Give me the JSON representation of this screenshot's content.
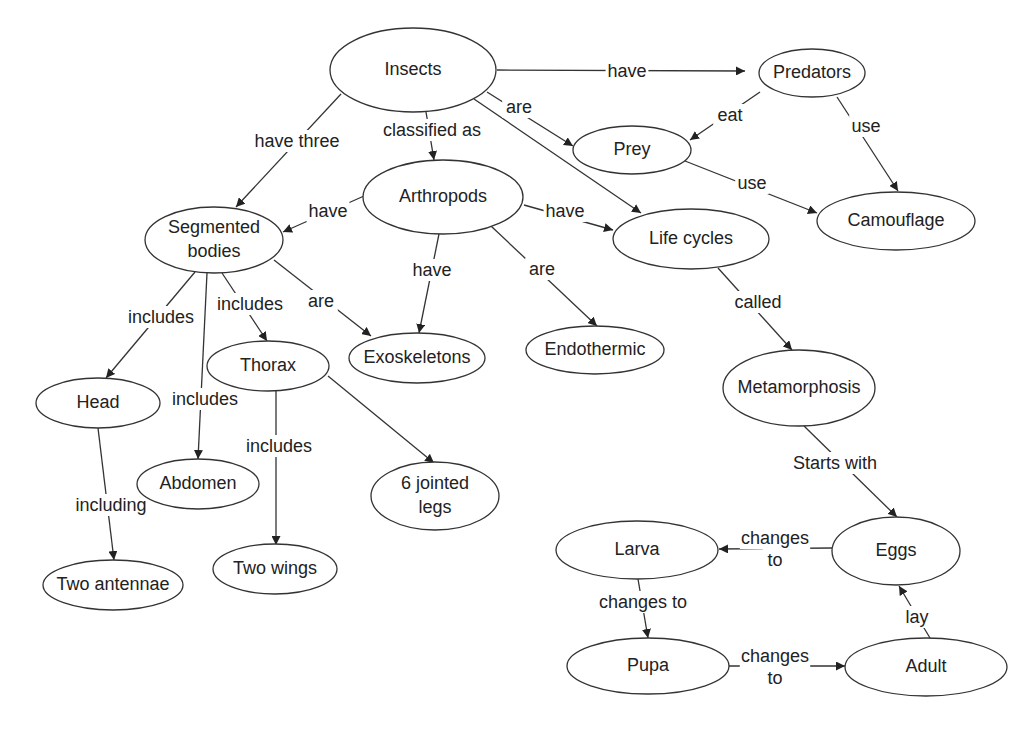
{
  "diagram": {
    "type": "concept-map",
    "topic": "Insects",
    "nodes": [
      {
        "id": "insects",
        "label": "Insects",
        "cx": 413,
        "cy": 70,
        "rx": 83,
        "ry": 42
      },
      {
        "id": "predators",
        "label": "Predators",
        "cx": 812,
        "cy": 73,
        "rx": 53,
        "ry": 24
      },
      {
        "id": "prey",
        "label": "Prey",
        "cx": 632,
        "cy": 150,
        "rx": 59,
        "ry": 24
      },
      {
        "id": "camouflage",
        "label": "Camouflage",
        "cx": 896,
        "cy": 221,
        "rx": 79,
        "ry": 29
      },
      {
        "id": "arthropods",
        "label": "Arthropods",
        "cx": 443,
        "cy": 197,
        "rx": 80,
        "ry": 37
      },
      {
        "id": "life-cycles",
        "label": "Life cycles",
        "cx": 691,
        "cy": 239,
        "rx": 78,
        "ry": 30
      },
      {
        "id": "segmented-bodies",
        "label": "Segmented bodies",
        "lines": [
          "Segmented",
          "bodies"
        ],
        "cx": 214,
        "cy": 240,
        "rx": 69,
        "ry": 33
      },
      {
        "id": "thorax",
        "label": "Thorax",
        "cx": 268,
        "cy": 366,
        "rx": 61,
        "ry": 25
      },
      {
        "id": "exoskeletons",
        "label": "Exoskeletons",
        "cx": 417,
        "cy": 358,
        "rx": 68,
        "ry": 25
      },
      {
        "id": "endothermic",
        "label": "Endothermic",
        "cx": 595,
        "cy": 350,
        "rx": 69,
        "ry": 24
      },
      {
        "id": "metamorphosis",
        "label": "Metamorphosis",
        "cx": 799,
        "cy": 388,
        "rx": 76,
        "ry": 38
      },
      {
        "id": "head",
        "label": "Head",
        "cx": 98,
        "cy": 403,
        "rx": 62,
        "ry": 25
      },
      {
        "id": "abdomen",
        "label": "Abdomen",
        "cx": 198,
        "cy": 484,
        "rx": 61,
        "ry": 25
      },
      {
        "id": "six-jointed-legs",
        "label": "6 jointed legs",
        "lines": [
          "6 jointed",
          "legs"
        ],
        "cx": 435,
        "cy": 496,
        "rx": 64,
        "ry": 34
      },
      {
        "id": "two-wings",
        "label": "Two wings",
        "cx": 275,
        "cy": 569,
        "rx": 62,
        "ry": 25
      },
      {
        "id": "two-antennae",
        "label": "Two antennae",
        "cx": 113,
        "cy": 585,
        "rx": 70,
        "ry": 25
      },
      {
        "id": "eggs",
        "label": "Eggs",
        "cx": 896,
        "cy": 551,
        "rx": 64,
        "ry": 34
      },
      {
        "id": "larva",
        "label": "Larva",
        "cx": 637,
        "cy": 550,
        "rx": 81,
        "ry": 29
      },
      {
        "id": "pupa",
        "label": "Pupa",
        "cx": 648,
        "cy": 666,
        "rx": 81,
        "ry": 28
      },
      {
        "id": "adult",
        "label": "Adult",
        "cx": 926,
        "cy": 667,
        "rx": 81,
        "ry": 29
      }
    ],
    "edges": [
      {
        "from": "insects",
        "to": "predators",
        "label": "have",
        "path": [
          [
            497,
            70
          ],
          [
            745,
            71
          ]
        ],
        "label_pos": [
          627,
          72
        ]
      },
      {
        "from": "insects",
        "to": "prey",
        "label": "are",
        "path": [
          [
            487,
            92
          ],
          [
            573,
            146
          ]
        ],
        "label_pos": [
          519,
          108
        ]
      },
      {
        "from": "insects",
        "to": "life-cycles",
        "label": "",
        "path": [
          [
            474,
            99
          ],
          [
            641,
            213
          ]
        ],
        "label_pos": null
      },
      {
        "from": "insects",
        "to": "arthropods",
        "label": "classified as",
        "path": [
          [
            426,
            112
          ],
          [
            434,
            160
          ]
        ],
        "label_pos": [
          432,
          131
        ]
      },
      {
        "from": "insects",
        "to": "segmented-bodies",
        "label": "have three",
        "path": [
          [
            341,
            94
          ],
          [
            236,
            207
          ]
        ],
        "label_pos": [
          297,
          142
        ]
      },
      {
        "from": "predators",
        "to": "prey",
        "label": "eat",
        "path": [
          [
            760,
            92
          ],
          [
            690,
            140
          ]
        ],
        "label_pos": [
          730,
          116
        ]
      },
      {
        "from": "predators",
        "to": "camouflage",
        "label": "use",
        "path": [
          [
            837,
            97
          ],
          [
            898,
            191
          ]
        ],
        "label_pos": [
          866,
          127
        ]
      },
      {
        "from": "prey",
        "to": "camouflage",
        "label": "use",
        "path": [
          [
            685,
            161
          ],
          [
            817,
            213
          ]
        ],
        "label_pos": [
          752,
          184
        ]
      },
      {
        "from": "arthropods",
        "to": "segmented-bodies",
        "label": "have",
        "path": [
          [
            364,
            196
          ],
          [
            283,
            232
          ]
        ],
        "label_pos": [
          328,
          212
        ]
      },
      {
        "from": "arthropods",
        "to": "life-cycles",
        "label": "have",
        "path": [
          [
            524,
            205
          ],
          [
            613,
            230
          ]
        ],
        "label_pos": [
          565,
          212
        ]
      },
      {
        "from": "arthropods",
        "to": "exoskeletons",
        "label": "have",
        "path": [
          [
            439,
            234
          ],
          [
            419,
            333
          ]
        ],
        "label_pos": [
          432,
          271
        ]
      },
      {
        "from": "arthropods",
        "to": "endothermic",
        "label": "are",
        "path": [
          [
            491,
            226
          ],
          [
            597,
            326
          ]
        ],
        "label_pos": [
          542,
          270
        ]
      },
      {
        "from": "segmented-bodies",
        "to": "head",
        "label": "includes",
        "path": [
          [
            195,
            272
          ],
          [
            106,
            378
          ]
        ],
        "label_pos": [
          161,
          318
        ]
      },
      {
        "from": "segmented-bodies",
        "to": "abdomen",
        "label": "includes",
        "path": [
          [
            207,
            273
          ],
          [
            198,
            459
          ]
        ],
        "label_pos": [
          205,
          400
        ]
      },
      {
        "from": "segmented-bodies",
        "to": "thorax",
        "label": "includes",
        "path": [
          [
            222,
            273
          ],
          [
            267,
            341
          ]
        ],
        "label_pos": [
          250,
          305
        ]
      },
      {
        "from": "segmented-bodies",
        "to": "exoskeletons",
        "label": "are",
        "path": [
          [
            274,
            260
          ],
          [
            371,
            336
          ]
        ],
        "label_pos": [
          321,
          302
        ]
      },
      {
        "from": "thorax",
        "to": "two-wings",
        "label": "includes",
        "path": [
          [
            276,
            391
          ],
          [
            276,
            545
          ]
        ],
        "label_pos": [
          279,
          447
        ]
      },
      {
        "from": "thorax",
        "to": "six-jointed-legs",
        "label": "",
        "path": [
          [
            328,
            376
          ],
          [
            434,
            463
          ]
        ],
        "label_pos": null
      },
      {
        "from": "head",
        "to": "two-antennae",
        "label": "including",
        "path": [
          [
            98,
            428
          ],
          [
            114,
            560
          ]
        ],
        "label_pos": [
          111,
          506
        ]
      },
      {
        "from": "life-cycles",
        "to": "metamorphosis",
        "label": "called",
        "path": [
          [
            718,
            268
          ],
          [
            792,
            350
          ]
        ],
        "label_pos": [
          758,
          303
        ]
      },
      {
        "from": "metamorphosis",
        "to": "eggs",
        "label": "Starts with",
        "path": [
          [
            804,
            426
          ],
          [
            897,
            517
          ]
        ],
        "label_pos": [
          835,
          464
        ]
      },
      {
        "from": "eggs",
        "to": "larva",
        "label": "changes to",
        "lines": [
          "changes",
          "to"
        ],
        "path": [
          [
            832,
            548
          ],
          [
            719,
            549
          ]
        ],
        "label_pos": [
          775,
          550
        ]
      },
      {
        "from": "larva",
        "to": "pupa",
        "label": "changes to",
        "path": [
          [
            638,
            579
          ],
          [
            648,
            638
          ]
        ],
        "label_pos": [
          643,
          603
        ]
      },
      {
        "from": "pupa",
        "to": "adult",
        "label": "changes to",
        "lines": [
          "changes",
          "to"
        ],
        "path": [
          [
            729,
            666
          ],
          [
            845,
            666
          ]
        ],
        "label_pos": [
          775,
          668
        ]
      },
      {
        "from": "adult",
        "to": "eggs",
        "label": "lay",
        "path": [
          [
            930,
            638
          ],
          [
            899,
            586
          ]
        ],
        "label_pos": [
          917,
          618
        ]
      }
    ]
  },
  "colors": {
    "stroke": "#333333",
    "text": "#222222",
    "background": "#ffffff"
  }
}
